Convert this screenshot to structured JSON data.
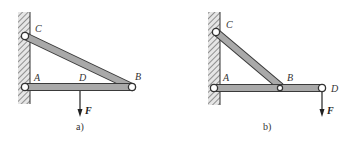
{
  "figures": [
    {
      "id": "a",
      "caption": "a)",
      "labels": {
        "C": "C",
        "A": "A",
        "D": "D",
        "B": "B",
        "F": "F"
      },
      "description": "Horizontal bar AB pinned to wall at A, strut CB pinned to wall at C; load F applied at midpoint region of AB (under D)"
    },
    {
      "id": "b",
      "caption": "b)",
      "labels": {
        "C": "C",
        "A": "A",
        "B": "B",
        "D": "D",
        "F": "F"
      },
      "description": "Horizontal bar AD pinned to wall at A, strut CB pinned at C and at B on the bar; load F applied at end D"
    }
  ],
  "colors": {
    "bar_fill": "#a9a9a9",
    "bar_stroke": "#3a3a3a",
    "wall_hatch": "#555555",
    "text": "#333333"
  }
}
